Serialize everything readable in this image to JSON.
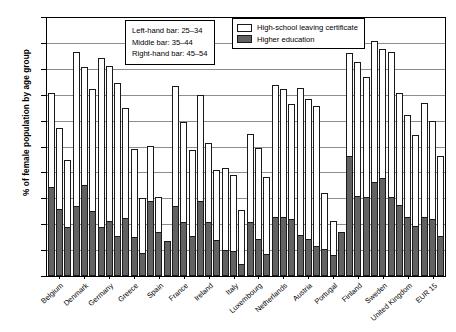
{
  "chart_data": {
    "type": "bar",
    "title": "",
    "xlabel": "",
    "ylabel": "% of female population by age group",
    "ylim": [
      0,
      100
    ],
    "ytick_values": [
      0,
      10,
      20,
      30,
      40,
      50,
      60,
      70,
      80,
      90,
      100
    ],
    "grid": true,
    "legend_position": "top-right",
    "categories": [
      "Belgium",
      "Denmark",
      "Germany",
      "Greece",
      "Spain",
      "France",
      "Ireland",
      "Italy",
      "Luxembourg",
      "Netherlands",
      "Austria",
      "Portugal",
      "Finland",
      "Sweden",
      "United Kingdom",
      "EUR 15"
    ],
    "age_groups": [
      "25-34",
      "35-44",
      "45-54"
    ],
    "series": [
      {
        "name": "High-school leaving certificate",
        "color": "#ffffff",
        "values_by_age": {
          "25-34": [
            71.0,
            87.0,
            84.5,
            65.3,
            50.3,
            73.8,
            70.0,
            42.0,
            55.0,
            74.0,
            73.0,
            32.0,
            86.5,
            91.0,
            71.0,
            67.0
          ],
          "35-44": [
            57.5,
            81.0,
            81.3,
            49.2,
            30.5,
            59.7,
            51.5,
            39.0,
            49.5,
            72.5,
            68.5,
            21.5,
            83.0,
            88.0,
            62.5,
            60.0
          ],
          "45-54": [
            45.0,
            72.5,
            74.7,
            30.2,
            13.5,
            48.7,
            41.0,
            25.5,
            38.5,
            66.5,
            66.0,
            16.5,
            77.0,
            87.0,
            54.5,
            46.5
          ]
        }
      },
      {
        "name": "Higher education",
        "color": "#626262",
        "values_by_age": {
          "25-34": [
            34.5,
            27.0,
            19.0,
            22.5,
            29.0,
            27.0,
            29.0,
            10.0,
            20.8,
            23.0,
            16.0,
            10.5,
            46.5,
            36.5,
            27.5,
            23.0
          ],
          "35-44": [
            26.0,
            35.2,
            21.3,
            15.0,
            17.0,
            20.8,
            20.8,
            9.8,
            14.3,
            23.0,
            14.3,
            8.0,
            31.0,
            38.0,
            23.0,
            22.0
          ],
          "45-54": [
            19.0,
            25.3,
            15.6,
            9.0,
            13.5,
            15.5,
            14.0,
            4.5,
            8.5,
            22.0,
            11.5,
            17.0,
            30.5,
            30.5,
            19.5,
            15.5
          ]
        }
      }
    ]
  },
  "annotations": {
    "bar_key": {
      "line1": "Left-hand bar: 25–34",
      "line2": "Middle bar: 35–44",
      "line3": "Right-hand bar: 45–54"
    },
    "legend": {
      "item1": "High-school leaving certificate",
      "item2": "Higher education"
    }
  }
}
